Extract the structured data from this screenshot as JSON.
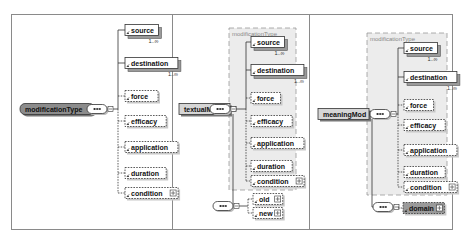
{
  "diagrams": [
    {
      "root": "modificationType",
      "root_style": "type",
      "group_label": "",
      "sequence_children": [
        {
          "name": "source",
          "optional": false,
          "occurs": "1..∞",
          "expandable": false
        },
        {
          "name": "destination",
          "optional": false,
          "occurs": "1..∞",
          "expandable": false
        },
        {
          "name": "force",
          "optional": true,
          "occurs": "",
          "expandable": false
        },
        {
          "name": "efficacy",
          "optional": true,
          "occurs": "",
          "expandable": false
        },
        {
          "name": "application",
          "optional": true,
          "occurs": "",
          "expandable": false
        },
        {
          "name": "duration",
          "optional": true,
          "occurs": "",
          "expandable": false
        },
        {
          "name": "condition",
          "optional": true,
          "occurs": "",
          "expandable": true
        }
      ],
      "extra_sequence": []
    },
    {
      "root": "textualMod",
      "root_style": "element",
      "group_label": "modificationType",
      "sequence_children": [
        {
          "name": "source",
          "optional": false,
          "occurs": "1..∞",
          "expandable": false
        },
        {
          "name": "destination",
          "optional": false,
          "occurs": "1..∞",
          "expandable": false
        },
        {
          "name": "force",
          "optional": true,
          "occurs": "",
          "expandable": false
        },
        {
          "name": "efficacy",
          "optional": true,
          "occurs": "",
          "expandable": false
        },
        {
          "name": "application",
          "optional": true,
          "occurs": "",
          "expandable": false
        },
        {
          "name": "duration",
          "optional": true,
          "occurs": "",
          "expandable": false
        },
        {
          "name": "condition",
          "optional": true,
          "occurs": "",
          "expandable": true
        }
      ],
      "extra_sequence": [
        {
          "name": "old",
          "optional": true,
          "occurs": "",
          "expandable": true
        },
        {
          "name": "new",
          "optional": true,
          "occurs": "",
          "expandable": true
        }
      ]
    },
    {
      "root": "meaningMod",
      "root_style": "element",
      "group_label": "modificationType",
      "sequence_children": [
        {
          "name": "source",
          "optional": false,
          "occurs": "1..∞",
          "expandable": false
        },
        {
          "name": "destination",
          "optional": false,
          "occurs": "1..∞",
          "expandable": false
        },
        {
          "name": "force",
          "optional": true,
          "occurs": "",
          "expandable": false
        },
        {
          "name": "efficacy",
          "optional": true,
          "occurs": "",
          "expandable": false
        },
        {
          "name": "application",
          "optional": true,
          "occurs": "",
          "expandable": false
        },
        {
          "name": "duration",
          "optional": true,
          "occurs": "",
          "expandable": false
        },
        {
          "name": "condition",
          "optional": true,
          "occurs": "",
          "expandable": true
        }
      ],
      "extra_sequence": [
        {
          "name": "domain",
          "optional": true,
          "occurs": "",
          "expandable": true,
          "shaded": true
        }
      ]
    }
  ],
  "colors": {
    "type_fill": "#8c8c8c",
    "element_fill": "#d6d6d6",
    "group_fill": "#ececec",
    "line": "#333333",
    "frame": "#8a8a8a"
  }
}
